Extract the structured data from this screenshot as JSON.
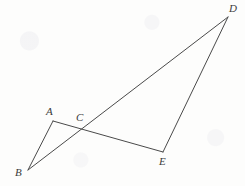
{
  "figure": {
    "kind": "geometry-diagram",
    "background_color": "#fdfdfc",
    "stroke_color": "#4a4a4a",
    "label_color": "#3b3b3b",
    "stroke_width": 1,
    "width": 245,
    "height": 186,
    "points": [
      {
        "id": "A",
        "label": "A",
        "x": 53,
        "y": 121,
        "label_x": 46,
        "label_y": 106
      },
      {
        "id": "B",
        "label": "B",
        "x": 28,
        "y": 170,
        "label_x": 15,
        "label_y": 167
      },
      {
        "id": "C",
        "label": "C",
        "x": 84,
        "y": 126,
        "label_x": 76,
        "label_y": 112
      },
      {
        "id": "D",
        "label": "D",
        "x": 228,
        "y": 17,
        "label_x": 229,
        "label_y": 3
      },
      {
        "id": "E",
        "label": "E",
        "x": 163,
        "y": 152,
        "label_x": 159,
        "label_y": 156
      }
    ],
    "segments": [
      {
        "id": "seg-B-A",
        "from": "B",
        "to": "A",
        "x1": 28,
        "y1": 170,
        "x2": 53,
        "y2": 121
      },
      {
        "id": "seg-A-E",
        "from": "A",
        "to": "E",
        "x1": 53,
        "y1": 121,
        "x2": 163,
        "y2": 152
      },
      {
        "id": "seg-B-D",
        "from": "B",
        "to": "D",
        "x1": 28,
        "y1": 170,
        "x2": 228,
        "y2": 17
      },
      {
        "id": "seg-E-D",
        "from": "E",
        "to": "D",
        "x1": 163,
        "y1": 152,
        "x2": 228,
        "y2": 17
      }
    ]
  }
}
